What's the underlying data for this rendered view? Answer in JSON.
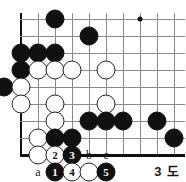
{
  "diagram": {
    "kind": "go-board-diagram",
    "caption": "3 도",
    "board": {
      "columns": 10,
      "rows": 9,
      "origin_x": 21,
      "origin_y": 19,
      "spacing": 17,
      "left_edge_is_border": true,
      "bottom_edge_is_border": true,
      "star_points": [
        {
          "col": 7,
          "row": 0
        }
      ]
    },
    "stones": [
      {
        "col": 2,
        "row": 0,
        "color": "black",
        "label": ""
      },
      {
        "col": 4,
        "row": 1,
        "color": "black",
        "label": ""
      },
      {
        "col": 0,
        "row": 2,
        "color": "black",
        "label": ""
      },
      {
        "col": 1,
        "row": 2,
        "color": "black",
        "label": ""
      },
      {
        "col": 2,
        "row": 2,
        "color": "black",
        "label": ""
      },
      {
        "col": 0,
        "row": 3,
        "color": "black",
        "label": ""
      },
      {
        "col": 1,
        "row": 3,
        "color": "white",
        "label": ""
      },
      {
        "col": 2,
        "row": 3,
        "color": "white",
        "label": ""
      },
      {
        "col": 3,
        "row": 3,
        "color": "white",
        "label": ""
      },
      {
        "col": 5,
        "row": 3,
        "color": "white",
        "label": ""
      },
      {
        "col": -1,
        "row": 4,
        "color": "black",
        "label": ""
      },
      {
        "col": 0,
        "row": 4,
        "color": "white",
        "label": ""
      },
      {
        "col": 0,
        "row": 5,
        "color": "white",
        "label": ""
      },
      {
        "col": 2,
        "row": 5,
        "color": "white",
        "label": ""
      },
      {
        "col": 5,
        "row": 5,
        "color": "white",
        "label": ""
      },
      {
        "col": 2,
        "row": 6,
        "color": "white",
        "label": ""
      },
      {
        "col": 4,
        "row": 6,
        "color": "black",
        "label": ""
      },
      {
        "col": 5,
        "row": 6,
        "color": "black",
        "label": ""
      },
      {
        "col": 6,
        "row": 6,
        "color": "black",
        "label": ""
      },
      {
        "col": 8,
        "row": 6,
        "color": "black",
        "label": ""
      },
      {
        "col": 9,
        "row": 7,
        "color": "black",
        "label": ""
      },
      {
        "col": 1,
        "row": 7,
        "color": "white",
        "label": ""
      },
      {
        "col": 2,
        "row": 7,
        "color": "black",
        "label": ""
      },
      {
        "col": 3,
        "row": 7,
        "color": "black",
        "label": ""
      },
      {
        "col": 1,
        "row": 8,
        "color": "white",
        "label": ""
      },
      {
        "col": 2,
        "row": 8,
        "color": "white",
        "label": "2"
      },
      {
        "col": 3,
        "row": 8,
        "color": "black",
        "label": "3"
      },
      {
        "col": 2,
        "row": 9,
        "color": "black",
        "label": "1"
      },
      {
        "col": 3,
        "row": 9,
        "color": "white",
        "label": "4"
      },
      {
        "col": 4,
        "row": 9,
        "color": "white",
        "label": ""
      },
      {
        "col": 5,
        "row": 9,
        "color": "black",
        "label": "5"
      }
    ],
    "point_labels": [
      {
        "col": 1,
        "row": 9,
        "text": "a"
      },
      {
        "col": 4,
        "row": 8,
        "text": "b"
      },
      {
        "col": 5,
        "row": 8,
        "text": "c"
      }
    ],
    "move_numbers": [
      "1",
      "2",
      "3",
      "4",
      "5"
    ],
    "colors": {
      "line": "#8a8a8a",
      "border": "#111111",
      "black_stone": "#111111",
      "white_stone": "#ffffff",
      "white_stone_outline": "#222222",
      "text": "#1a1a1a"
    }
  }
}
